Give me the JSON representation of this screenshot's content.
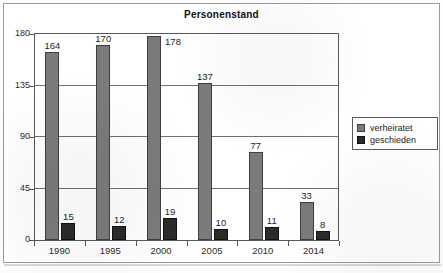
{
  "chart_data": {
    "type": "bar",
    "title": "Personenstand",
    "xlabel": "",
    "ylabel": "",
    "categories": [
      "1990",
      "1995",
      "2000",
      "2005",
      "2010",
      "2014"
    ],
    "series": [
      {
        "name": "verheiratet",
        "color": "#7b7b7b",
        "values": [
          164,
          170,
          178,
          137,
          77,
          33
        ]
      },
      {
        "name": "geschieden",
        "color": "#2b2b2b",
        "values": [
          15,
          12,
          19,
          10,
          11,
          8
        ]
      }
    ],
    "ylim": [
      0,
      180
    ],
    "yticks": [
      0,
      45,
      90,
      135,
      180
    ],
    "grid": "horizontal",
    "legend_position": "right",
    "data_labels": true
  },
  "legend": {
    "items": [
      {
        "label": "verheiratet",
        "swatch": "married-swatch"
      },
      {
        "label": "geschieden",
        "swatch": "divorced-swatch"
      }
    ]
  }
}
